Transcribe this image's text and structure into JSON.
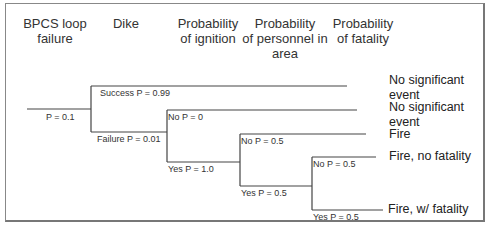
{
  "diagram": {
    "type": "event-tree",
    "headers": [
      {
        "id": "initiating",
        "label": "BPCS loop failure"
      },
      {
        "id": "dike",
        "label": "Dike"
      },
      {
        "id": "ignition",
        "label": "Probability of ignition"
      },
      {
        "id": "personnel",
        "label": "Probability of personnel in area"
      },
      {
        "id": "fatality",
        "label": "Probability of fatality"
      }
    ],
    "header_lines": {
      "initiating": [
        "BPCS loop",
        "failure"
      ],
      "dike": [
        "Dike"
      ],
      "ignition": [
        "Probability",
        "of ignition"
      ],
      "personnel": [
        "Probability",
        "of personnel in",
        "area"
      ],
      "fatality": [
        "Probability",
        "of fatality"
      ]
    },
    "initiating_event": {
      "label": "P = 0.1"
    },
    "branches": {
      "dike_success": "Success P = 0.99",
      "dike_failure": "Failure P = 0.01",
      "ignition_no": "No P = 0",
      "ignition_yes": "Yes P = 1.0",
      "personnel_no": "No P = 0.5",
      "personnel_yes": "Yes P = 0.5",
      "fatality_no": "No P = 0.5",
      "fatality_yes": "Yes P = 0.5"
    },
    "outcomes": [
      {
        "id": "o1",
        "lines": [
          "No significant",
          "event"
        ]
      },
      {
        "id": "o2",
        "lines": [
          "No significant",
          "event"
        ]
      },
      {
        "id": "o3",
        "lines": [
          "Fire"
        ]
      },
      {
        "id": "o4",
        "lines": [
          "Fire, no fatality"
        ]
      },
      {
        "id": "o5",
        "lines": [
          "Fire, w/ fatality"
        ]
      }
    ],
    "line_color": "#444444"
  }
}
